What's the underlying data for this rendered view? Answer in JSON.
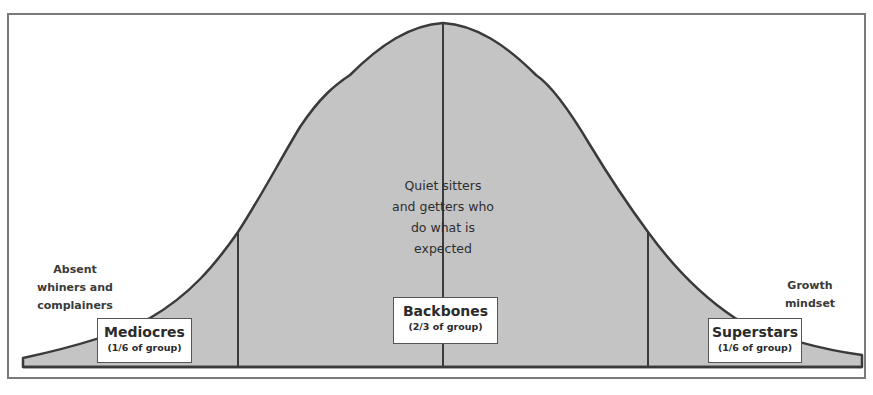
{
  "diagram": {
    "type": "bell-curve",
    "colors": {
      "fill": "#c4c4c4",
      "outline": "#3a3a3a",
      "frame": "#7a7a7a",
      "label_bg": "#ffffff",
      "text": "#2b2b2b"
    },
    "segments": [
      {
        "id": "left",
        "label": "Mediocres",
        "share": "(1/6 of group)",
        "description_lines": [
          "Absent",
          "whiners and",
          "complainers"
        ]
      },
      {
        "id": "center",
        "label": "Backbones",
        "share": "(2/3 of group)",
        "description_lines": [
          "Quiet sitters",
          "and getters who",
          "do what is",
          "expected"
        ]
      },
      {
        "id": "right",
        "label": "Superstars",
        "share": "(1/6 of group)",
        "description_lines": [
          "Growth",
          "mindset"
        ]
      }
    ]
  }
}
